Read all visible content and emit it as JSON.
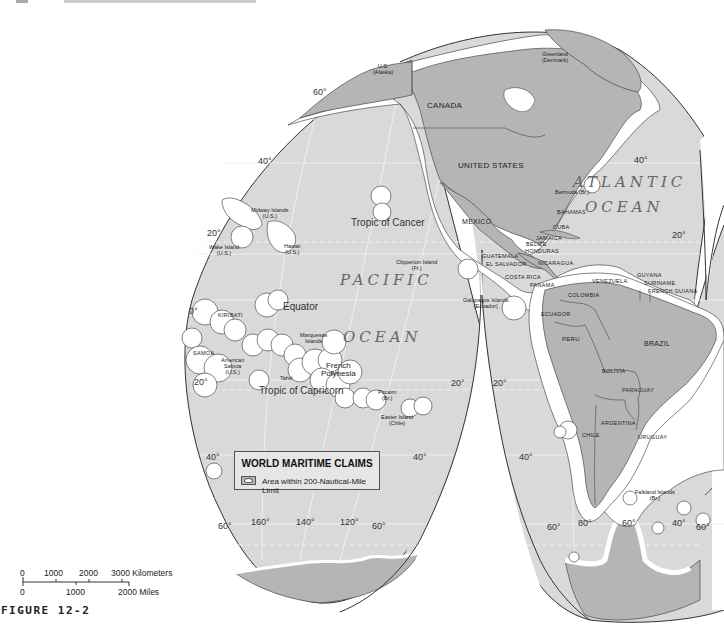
{
  "figure": {
    "label": "FIGURE 12-2",
    "projection": "interrupted (Goode-style) projection, Pacific and Americas lobes"
  },
  "colors": {
    "ocean": "#d9d9d9",
    "land": "#b5b5b5",
    "claim_zone": "#ffffff",
    "outline": "#333333",
    "background": "#ffffff"
  },
  "legend": {
    "title": "WORLD MARITIME CLAIMS",
    "item_label": "Area within 200-Nautical-Mile Limit"
  },
  "scale_bar": {
    "km_ticks": [
      "0",
      "1000",
      "2000",
      "3000 Kilometers"
    ],
    "mile_ticks": [
      "0",
      "1000",
      "2000 Miles"
    ]
  },
  "oceans": [
    {
      "name_line1": "PACIFIC",
      "name_line2": "OCEAN"
    },
    {
      "name_line1": "ATLANTIC",
      "name_line2": "OCEAN"
    }
  ],
  "countries": {
    "canada": "CANADA",
    "united_states": "UNITED STATES",
    "mexico": "MEXICO",
    "guatemala": "GUATEMALA",
    "el_salvador": "EL SALVADOR",
    "belize": "BELIZE",
    "honduras": "HONDURAS",
    "nicaragua": "NICARAGUA",
    "costa_rica": "COSTA RICA",
    "panama": "PANAMA",
    "cuba": "CUBA",
    "jamaica": "JAMAICA",
    "bahamas": "BAHAMAS",
    "colombia": "COLOMBIA",
    "venezuela": "VENEZUELA",
    "guyana": "GUYANA",
    "suriname": "SURINAME",
    "french_guiana": "FRENCH GUIANA",
    "ecuador": "ECUADOR",
    "peru": "PERU",
    "brazil": "BRAZIL",
    "bolivia": "BOLIVIA",
    "paraguay": "PARAGUAY",
    "argentina": "ARGENTINA",
    "uruguay": "URUGUAY",
    "chile": "CHILE",
    "kiribati": "KIRIBATI",
    "samoa": "SAMOA"
  },
  "territories": {
    "alaska": [
      "U.S.",
      "(Alaska)"
    ],
    "greenland": [
      "Greenland",
      "(Denmark)"
    ],
    "midway": [
      "Midway Islands",
      "(U.S.)"
    ],
    "wake": [
      "Wake Island",
      "(U.S.)"
    ],
    "hawaii": [
      "Hawaii",
      "(U.S.)"
    ],
    "clipperton": [
      "Clipperton Island",
      "(Fr.)"
    ],
    "galapagos": [
      "Galápagos Islands",
      "(Ecuador)"
    ],
    "marquesas": [
      "Marquesas",
      "Islands"
    ],
    "american_samoa": [
      "American",
      "Samoa",
      "(U.S.)"
    ],
    "french_polynesia": [
      "French",
      "Polynesia"
    ],
    "tahiti": "Tahiti",
    "pitcairn": [
      "Pitcairn",
      "(Br.)"
    ],
    "easter": [
      "Easter Island",
      "(Chile)"
    ],
    "bermuda": "Bermuda (Br.)",
    "falkland": [
      "Falkland Islands",
      "(Br.)"
    ]
  },
  "features": {
    "tropic_cancer": "Tropic of Cancer",
    "equator": "Equator",
    "tropic_capricorn": "Tropic of Capricorn"
  },
  "graticule": {
    "lat_labels": [
      "60°",
      "40°",
      "20°",
      "0°",
      "20°",
      "40°",
      "60°"
    ],
    "pacific": {
      "n60": "60°",
      "n40": "40°",
      "n20": "20°",
      "eq": "0°",
      "s20_left": "20°",
      "s20_right": "20°",
      "s40_left": "40°",
      "s40_right": "40°",
      "s60_left": "60°",
      "s60_right": "60°"
    },
    "americas": {
      "n40": "40°",
      "n20": "20°",
      "s20": "20°",
      "s40": "40°",
      "s60_left": "60°",
      "s60_right": "60°"
    },
    "lon_labels_pacific": [
      "160°",
      "140°",
      "120°"
    ],
    "lon_labels_americas": [
      "80°",
      "60°",
      "40°"
    ]
  }
}
